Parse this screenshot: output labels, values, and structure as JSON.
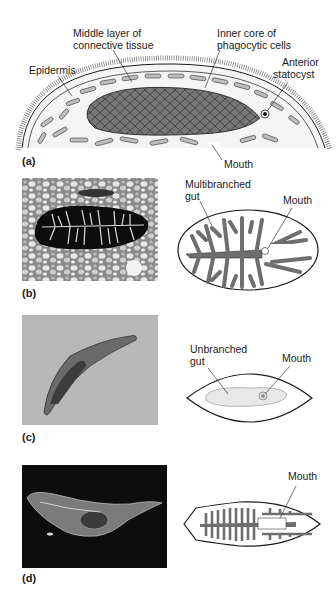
{
  "figure": {
    "panels": [
      {
        "id": "a",
        "letter": "(a)",
        "labels": {
          "middle_layer_1": "Middle layer of",
          "middle_layer_2": "connective tissue",
          "inner_core_1": "Inner core of",
          "inner_core_2": "phagocytic cells",
          "epidermis": "Epidermis",
          "statocyst_1": "Anterior",
          "statocyst_2": "statocyst",
          "mouth": "Mouth"
        }
      },
      {
        "id": "b",
        "letter": "(b)",
        "labels": {
          "gut_1": "Multibranched",
          "gut_2": "gut",
          "mouth": "Mouth"
        }
      },
      {
        "id": "c",
        "letter": "(c)",
        "labels": {
          "gut_1": "Unbranched",
          "gut_2": "gut",
          "mouth": "Mouth"
        }
      },
      {
        "id": "d",
        "letter": "(d)",
        "labels": {
          "mouth": "Mouth"
        }
      }
    ],
    "colors": {
      "outline": "#1a1a1a",
      "gut_fill": "#6e6e6e",
      "cell_fill": "#7a7a7a",
      "light_fill": "#d9d9d9",
      "photo_dark": "#0d0d0d"
    }
  }
}
